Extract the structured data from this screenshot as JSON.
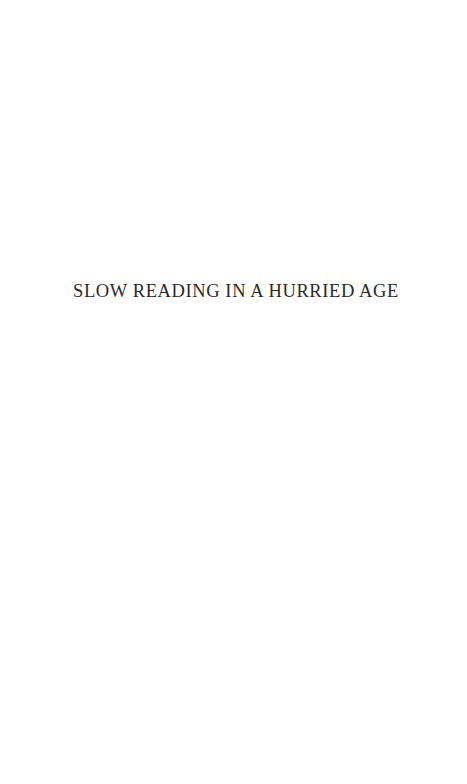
{
  "page": {
    "type": "half-title",
    "background": "#ffffff",
    "text_color": "#2a2a2a"
  },
  "half_title": {
    "text": "SLOW READING IN A HURRIED AGE"
  }
}
